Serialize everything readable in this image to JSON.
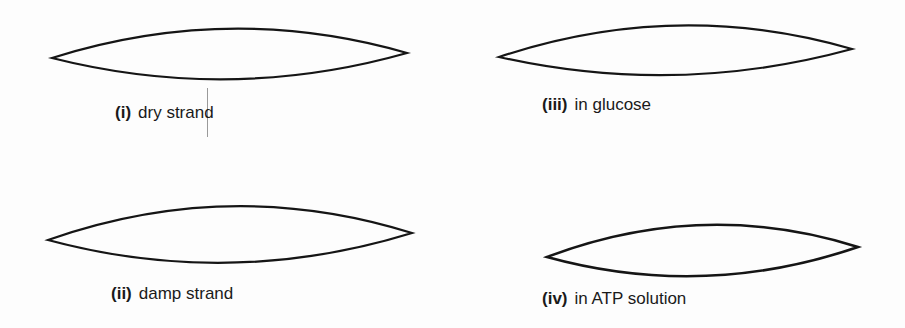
{
  "figure": {
    "panels": [
      {
        "id": "i",
        "numeral": "(i)",
        "caption": "dry strand"
      },
      {
        "id": "ii",
        "numeral": "(ii)",
        "caption": "damp strand"
      },
      {
        "id": "iii",
        "numeral": "(iii)",
        "caption": "in glucose"
      },
      {
        "id": "iv",
        "numeral": "(iv)",
        "caption": "in ATP solution"
      }
    ]
  }
}
